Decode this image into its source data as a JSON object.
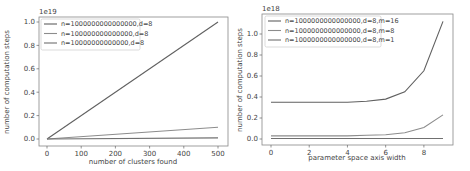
{
  "chart_data": [
    {
      "type": "line",
      "title": "",
      "offset_label": "1e19",
      "xlabel": "number of clusters found",
      "ylabel": "number of computation steps",
      "x": [
        0,
        500
      ],
      "xticks": [
        "0",
        "100",
        "200",
        "300",
        "400",
        "500"
      ],
      "yticks": [
        "0.0",
        "0.2",
        "0.4",
        "0.6",
        "0.8",
        "1.0"
      ],
      "xlim": [
        -25,
        525
      ],
      "ylim": [
        -0.05,
        1.05
      ],
      "grid": false,
      "legend_position": "upper left",
      "series": [
        {
          "name": "n=1000000000000000,d=8",
          "values": [
            0,
            1.0
          ],
          "color": "#606060"
        },
        {
          "name": "n=100000000000000,d=8",
          "values": [
            0,
            0.1
          ],
          "color": "#8c8c8c"
        },
        {
          "name": "n=10000000000000,d=8",
          "values": [
            0,
            0.01
          ],
          "color": "#707070"
        }
      ]
    },
    {
      "type": "line",
      "title": "",
      "offset_label": "1e18",
      "xlabel": "parameter space axis width",
      "ylabel": "number of computation steps",
      "x": [
        0,
        1,
        2,
        3,
        4,
        5,
        6,
        7,
        8,
        9
      ],
      "xticks": [
        "0",
        "2",
        "4",
        "6",
        "8"
      ],
      "yticks": [
        "0.0",
        "0.2",
        "0.4",
        "0.6",
        "0.8",
        "1.0"
      ],
      "xlim": [
        -0.45,
        9.45
      ],
      "ylim": [
        -0.05,
        1.18
      ],
      "grid": false,
      "legend_position": "upper left",
      "series": [
        {
          "name": "n=1000000000000000,d=8,m=16",
          "values": [
            0.35,
            0.35,
            0.35,
            0.35,
            0.35,
            0.36,
            0.38,
            0.45,
            0.65,
            1.12
          ],
          "color": "#606060"
        },
        {
          "name": "n=1000000000000000,d=8,m=8",
          "values": [
            0.03,
            0.03,
            0.03,
            0.03,
            0.03,
            0.035,
            0.04,
            0.06,
            0.11,
            0.23
          ],
          "color": "#8c8c8c"
        },
        {
          "name": "n=1000000000000000,d=8,m=1",
          "values": [
            0.005,
            0.005,
            0.005,
            0.005,
            0.005,
            0.005,
            0.005,
            0.005,
            0.005,
            0.005
          ],
          "color": "#707070"
        }
      ]
    }
  ]
}
